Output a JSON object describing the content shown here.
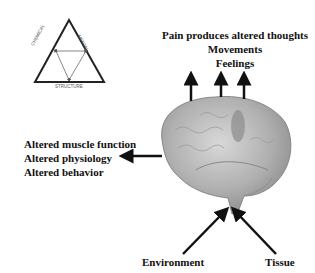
{
  "triangle": {
    "left_label": "CHEMICAL",
    "right_label": "MENTAL",
    "bottom_label": "STRUCTURE"
  },
  "top_labels": [
    "Pain produces altered thoughts",
    "Movements",
    "Feelings"
  ],
  "left_labels": [
    "Altered muscle function",
    "Altered physiology",
    "Altered behavior"
  ],
  "bottom_labels": {
    "left": "Environment",
    "right": "Tissue"
  }
}
